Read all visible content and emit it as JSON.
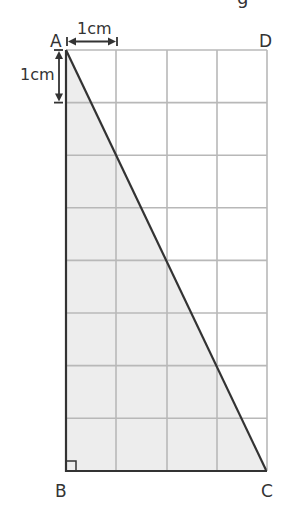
{
  "diagram": {
    "vertices": {
      "A": "A",
      "B": "B",
      "C": "C",
      "D": "D"
    },
    "scale": {
      "horizontal": "1cm",
      "vertical": "1cm"
    },
    "grid": {
      "columns": 4,
      "rows": 8
    },
    "shape": "right triangle ABC",
    "right_angle_at": "B",
    "colors": {
      "grid": "#b8b8b8",
      "outline": "#333333",
      "fill": "#ededed",
      "text": "#333333"
    },
    "clipped_top_glyph": "g"
  }
}
